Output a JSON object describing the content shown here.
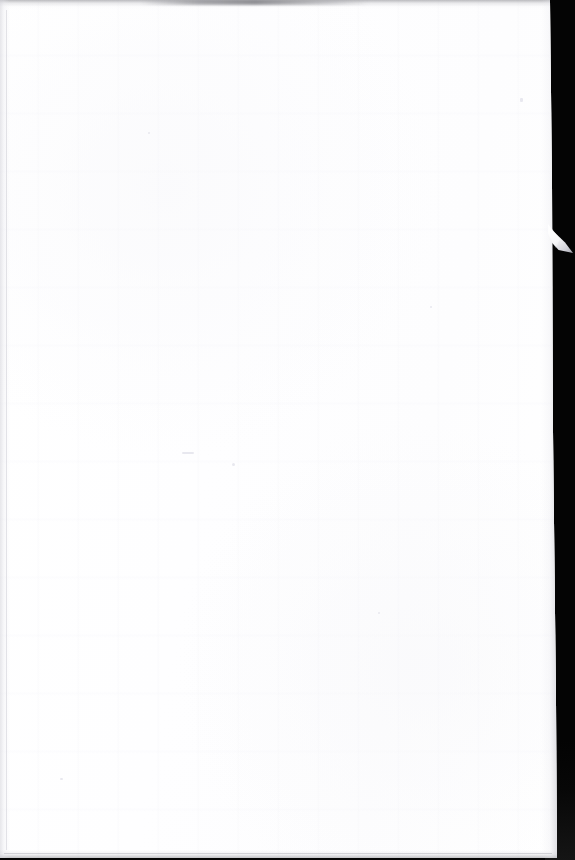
{
  "document": {
    "type": "scanned-page",
    "page_content": "",
    "page_state_label": "Blank page",
    "orientation": "portrait"
  },
  "canvas": {
    "width_px": 575,
    "height_px": 860
  },
  "paper": {
    "width_px": 557,
    "height_px": 858,
    "color": "#ffffff",
    "tone_warm": "#fdfdfe",
    "tone_cool": "#fafafc"
  },
  "scanner": {
    "backdrop_color": "#040404",
    "backdrop_falloff_color": "#151515",
    "band_left_edge_px": 550,
    "band_width_px": 25
  },
  "artifacts": {
    "torn_flap": {
      "label": "torn paper flap",
      "left_px": 549,
      "top_px": 226,
      "width_px": 24,
      "height_px": 28,
      "shadow_color": "#9a9aa4"
    },
    "edge_shadow_top_color": "#78787e",
    "edge_shadow_bottom_color": "#8a8a90",
    "edge_shadow_left_color": "#d6d6dc",
    "edge_shadow_right_color": "#c6c6ce",
    "margin_rule_color": "#ced0d6",
    "speck_color": "#e4e4ec"
  }
}
